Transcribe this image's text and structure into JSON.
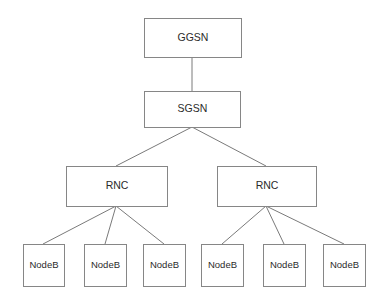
{
  "diagram": {
    "type": "hierarchy-tree",
    "background_color": "#ffffff",
    "box_fill": "#ffffff",
    "box_stroke": "#868686",
    "line_stroke": "#7a7a7a",
    "text_color": "#2b2b2b",
    "levels": [
      {
        "level": 1,
        "name": "core-gateway",
        "nodes": [
          {
            "id": "ggsn",
            "label": "GGSN",
            "x": 144,
            "y": 18,
            "w": 97,
            "h": 39
          }
        ]
      },
      {
        "level": 2,
        "name": "core-serving",
        "nodes": [
          {
            "id": "sgsn",
            "label": "SGSN",
            "x": 144,
            "y": 91,
            "w": 96,
            "h": 36
          }
        ]
      },
      {
        "level": 3,
        "name": "radio-network-controllers",
        "nodes": [
          {
            "id": "rnc-left",
            "label": "RNC",
            "x": 66,
            "y": 166,
            "w": 101,
            "h": 40
          },
          {
            "id": "rnc-right",
            "label": "RNC",
            "x": 217,
            "y": 166,
            "w": 99,
            "h": 40
          }
        ]
      },
      {
        "level": 4,
        "name": "base-stations",
        "nodes": [
          {
            "id": "nodeb-1",
            "label": "NodeB",
            "x": 23,
            "y": 244,
            "w": 41,
            "h": 42
          },
          {
            "id": "nodeb-2",
            "label": "NodeB",
            "x": 84,
            "y": 244,
            "w": 42,
            "h": 42
          },
          {
            "id": "nodeb-3",
            "label": "NodeB",
            "x": 143,
            "y": 244,
            "w": 42,
            "h": 42
          },
          {
            "id": "nodeb-4",
            "label": "NodeB",
            "x": 201,
            "y": 244,
            "w": 42,
            "h": 42
          },
          {
            "id": "nodeb-5",
            "label": "NodeB",
            "x": 263,
            "y": 244,
            "w": 42,
            "h": 42
          },
          {
            "id": "nodeb-6",
            "label": "NodeB",
            "x": 323,
            "y": 244,
            "w": 42,
            "h": 42
          }
        ]
      }
    ],
    "edges": [
      {
        "id": "edge-ggsn-sgsn",
        "from": "ggsn",
        "to": "sgsn",
        "x1": 192,
        "y1": 57,
        "x2": 192,
        "y2": 91
      },
      {
        "id": "edge-sgsn-rnc-left",
        "from": "sgsn",
        "to": "rnc-left",
        "x1": 192,
        "y1": 127,
        "x2": 116,
        "y2": 166
      },
      {
        "id": "edge-sgsn-rnc-right",
        "from": "sgsn",
        "to": "rnc-right",
        "x1": 192,
        "y1": 127,
        "x2": 266,
        "y2": 166
      },
      {
        "id": "edge-rnc-left-nodeb-1",
        "from": "rnc-left",
        "to": "nodeb-1",
        "x1": 116,
        "y1": 206,
        "x2": 43,
        "y2": 244
      },
      {
        "id": "edge-rnc-left-nodeb-2",
        "from": "rnc-left",
        "to": "nodeb-2",
        "x1": 116,
        "y1": 206,
        "x2": 105,
        "y2": 244
      },
      {
        "id": "edge-rnc-left-nodeb-3",
        "from": "rnc-left",
        "to": "nodeb-3",
        "x1": 116,
        "y1": 206,
        "x2": 164,
        "y2": 244
      },
      {
        "id": "edge-rnc-right-nodeb-4",
        "from": "rnc-right",
        "to": "nodeb-4",
        "x1": 266,
        "y1": 206,
        "x2": 222,
        "y2": 244
      },
      {
        "id": "edge-rnc-right-nodeb-5",
        "from": "rnc-right",
        "to": "nodeb-5",
        "x1": 266,
        "y1": 206,
        "x2": 284,
        "y2": 244
      },
      {
        "id": "edge-rnc-right-nodeb-6",
        "from": "rnc-right",
        "to": "nodeb-6",
        "x1": 266,
        "y1": 206,
        "x2": 344,
        "y2": 244
      }
    ]
  },
  "labels": {
    "ggsn": "GGSN",
    "sgsn": "SGSN",
    "rnc_left": "RNC",
    "rnc_right": "RNC",
    "nodeb_1": "NodeB",
    "nodeb_2": "NodeB",
    "nodeb_3": "NodeB",
    "nodeb_4": "NodeB",
    "nodeb_5": "NodeB",
    "nodeb_6": "NodeB"
  }
}
